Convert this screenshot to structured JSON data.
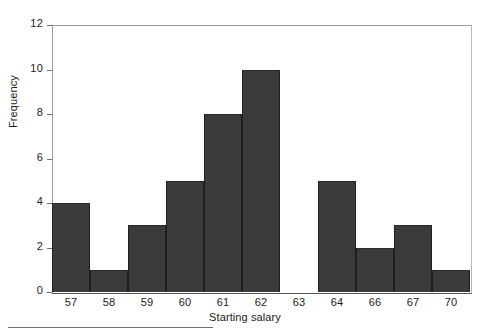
{
  "chart_data": {
    "type": "bar",
    "title": "",
    "subtitle": "",
    "xlabel": "Starting salary",
    "ylabel": "Frequency",
    "categories": [
      "57",
      "58",
      "59",
      "60",
      "61",
      "62",
      "63",
      "64",
      "66",
      "67",
      "70"
    ],
    "values": [
      4,
      1,
      3,
      5,
      8,
      10,
      0,
      5,
      2,
      3,
      1
    ],
    "series": [
      {
        "name": "Frequency",
        "values": [
          4,
          1,
          3,
          5,
          8,
          10,
          0,
          5,
          2,
          3,
          1
        ]
      }
    ],
    "ylim": [
      0,
      12
    ],
    "yticks": [
      0,
      2,
      4,
      6,
      8,
      10,
      12
    ],
    "yticklabels": [
      "0",
      "2",
      "4",
      "6",
      "8",
      "10",
      "12"
    ],
    "grid": false,
    "legend": false,
    "legend_position": "none",
    "annotations": [],
    "bar_color": "#3b3b3b",
    "bar_edge_color": "#1f1f1f",
    "axis_color": "#9a9a9a",
    "text_color": "#1a1a1a",
    "background_color": "#ffffff"
  },
  "axes": {
    "y_title": "Frequency",
    "x_title": "Starting salary"
  }
}
